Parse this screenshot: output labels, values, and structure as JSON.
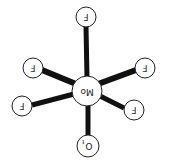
{
  "diagram": {
    "center_atom": {
      "label": "Mo"
    },
    "atoms": [
      {
        "id": "F_top",
        "label": "F"
      },
      {
        "id": "F_upper_left",
        "label": "F"
      },
      {
        "id": "F_upper_right",
        "label": "F"
      },
      {
        "id": "F_lower_left",
        "label": "F"
      },
      {
        "id": "F_lower_right",
        "label": "F"
      },
      {
        "id": "O_bottom",
        "label": "O",
        "subscript": "t"
      }
    ],
    "colors": {
      "bond": "#111111",
      "atom_fill": "#ffffff",
      "atom_stroke": "#222222"
    }
  }
}
